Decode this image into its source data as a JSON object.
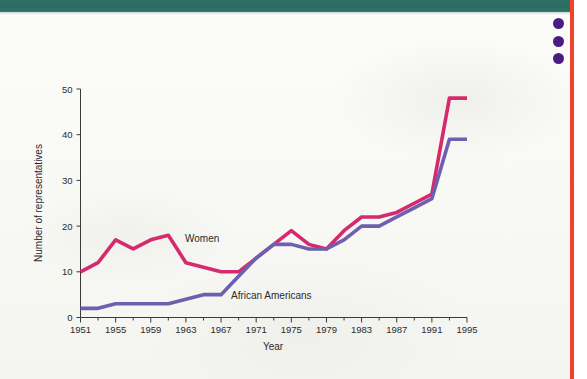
{
  "page": {
    "background_color": "#fbfbf8",
    "top_band_color": "#2d7166",
    "right_rule_color": "#f4422a",
    "dot_color": "#4c1d80",
    "dot_count": 3
  },
  "chart_data": {
    "type": "line",
    "title": "",
    "xlabel": "Year",
    "ylabel": "Number of representatives",
    "xlim": [
      1951,
      1995
    ],
    "ylim": [
      0,
      50
    ],
    "xticks": [
      1951,
      1955,
      1959,
      1963,
      1967,
      1971,
      1975,
      1979,
      1983,
      1987,
      1991,
      1995
    ],
    "xticks_minor": [
      1953,
      1957,
      1961,
      1965,
      1969,
      1973,
      1977,
      1981,
      1985,
      1989,
      1993
    ],
    "yticks": [
      0,
      10,
      20,
      30,
      40,
      50
    ],
    "xtick_labels": [
      "1951",
      "1955",
      "1959",
      "1963",
      "1967",
      "1971",
      "1975",
      "1979",
      "1983",
      "1987",
      "1991",
      "1995"
    ],
    "ytick_labels": [
      "0",
      "10",
      "20",
      "30",
      "40",
      "50"
    ],
    "grid": false,
    "legend": "inline-annotations",
    "x": [
      1951,
      1953,
      1955,
      1957,
      1959,
      1961,
      1963,
      1965,
      1967,
      1969,
      1971,
      1973,
      1975,
      1977,
      1979,
      1981,
      1983,
      1985,
      1987,
      1989,
      1991,
      1993,
      1995
    ],
    "series": [
      {
        "name": "Women",
        "color": "#d62a6e",
        "label_text": "Women",
        "values": [
          10,
          12,
          17,
          15,
          17,
          18,
          12,
          11,
          10,
          10,
          13,
          16,
          19,
          16,
          15,
          19,
          22,
          22,
          23,
          25,
          27,
          48,
          48
        ]
      },
      {
        "name": "African Americans",
        "color": "#6f5fb0",
        "label_text": "African Americans",
        "values": [
          2,
          2,
          3,
          3,
          3,
          3,
          4,
          5,
          5,
          9,
          13,
          16,
          16,
          15,
          15,
          17,
          20,
          20,
          22,
          24,
          26,
          39,
          39
        ]
      }
    ]
  }
}
